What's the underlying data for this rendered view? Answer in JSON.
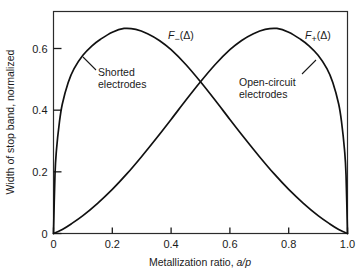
{
  "chart_data": {
    "type": "line",
    "title": "",
    "subtitle": "",
    "xlabel_text": "Metallization ratio, ",
    "xlabel_italic": "a/p",
    "ylabel": "Width of stop band, normalized",
    "xlim": [
      0,
      1.0
    ],
    "ylim": [
      0,
      0.72
    ],
    "grid": false,
    "legend_position": "inline-curve-labels",
    "xticks": [
      0,
      0.2,
      0.4,
      0.6,
      0.8,
      1.0
    ],
    "xtick_labels": [
      "0",
      "0.2",
      "0.4",
      "0.6",
      "0.8",
      "1.0"
    ],
    "yticks": [
      0,
      0.2,
      0.4,
      0.6
    ],
    "ytick_labels": [
      "0",
      "0.2",
      "0.4",
      "0.6"
    ],
    "series": [
      {
        "name": "F_minus",
        "label_prefix": "F",
        "label_sub": "−",
        "label_suffix": "(Δ)",
        "annotation": "Shorted electrodes",
        "annotation_line1": "Shorted",
        "annotation_line2": "electrodes",
        "color": "#111111",
        "peak_x": 0.24,
        "peak_y": 0.665,
        "x": [
          0.0,
          0.005,
          0.01,
          0.02,
          0.03,
          0.05,
          0.07,
          0.1,
          0.13,
          0.16,
          0.2,
          0.24,
          0.28,
          0.32,
          0.36,
          0.4,
          0.45,
          0.5,
          0.55,
          0.6,
          0.65,
          0.7,
          0.75,
          0.8,
          0.85,
          0.9,
          0.94,
          0.97,
          0.99,
          1.0
        ],
        "y": [
          0.0,
          0.19,
          0.27,
          0.36,
          0.42,
          0.49,
          0.535,
          0.578,
          0.608,
          0.63,
          0.653,
          0.665,
          0.662,
          0.648,
          0.626,
          0.596,
          0.548,
          0.492,
          0.432,
          0.37,
          0.309,
          0.25,
          0.194,
          0.143,
          0.098,
          0.058,
          0.031,
          0.013,
          0.004,
          0.0
        ]
      },
      {
        "name": "F_plus",
        "label_prefix": "F",
        "label_sub": "+",
        "label_suffix": "(Δ)",
        "annotation": "Open-circuit electrodes",
        "annotation_line1": "Open-circuit",
        "annotation_line2": "electrodes",
        "color": "#111111",
        "peak_x": 0.76,
        "peak_y": 0.665,
        "x": [
          0.0,
          0.01,
          0.03,
          0.06,
          0.1,
          0.15,
          0.2,
          0.25,
          0.3,
          0.35,
          0.4,
          0.45,
          0.5,
          0.55,
          0.6,
          0.64,
          0.68,
          0.72,
          0.76,
          0.8,
          0.84,
          0.87,
          0.9,
          0.93,
          0.95,
          0.97,
          0.98,
          0.99,
          0.995,
          1.0
        ],
        "y": [
          0.0,
          0.004,
          0.013,
          0.031,
          0.058,
          0.098,
          0.143,
          0.194,
          0.25,
          0.309,
          0.37,
          0.432,
          0.492,
          0.548,
          0.596,
          0.626,
          0.648,
          0.662,
          0.665,
          0.653,
          0.63,
          0.608,
          0.578,
          0.535,
          0.49,
          0.42,
          0.36,
          0.27,
          0.19,
          0.0
        ]
      }
    ]
  }
}
